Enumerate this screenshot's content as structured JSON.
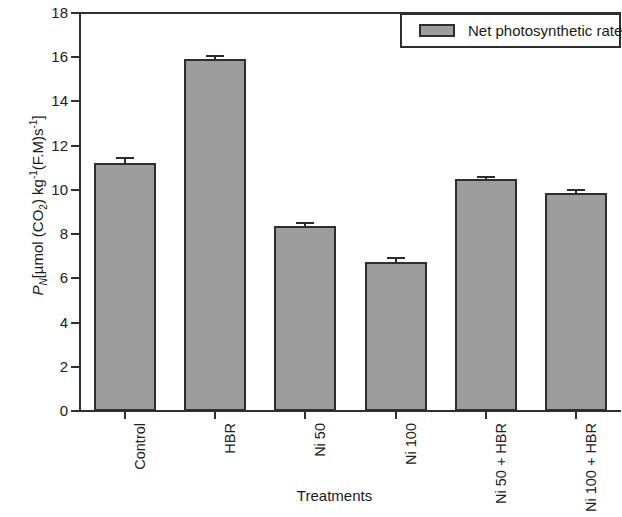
{
  "chart_data": {
    "type": "bar",
    "title": "",
    "xlabel": "Treatments",
    "ylabel_parts": {
      "symbol": "P",
      "subscript": "N",
      "rest_open": "[µmol (CO",
      "co2_sub": "2",
      "rest_mid": ") kg",
      "sup1": "-1",
      "rest_fm": "(F.M)s",
      "sup2": "-1",
      "rest_close": "]"
    },
    "ylabel_text": "PN[µmol (CO2) kg-1(F.M)s-1]",
    "categories": [
      "Control",
      "HBR",
      "Ni 50",
      "Ni 100",
      "Ni 50 + HBR",
      "Ni 100 + HBR"
    ],
    "values": [
      11.2,
      15.9,
      8.35,
      6.75,
      10.5,
      9.85
    ],
    "errors": [
      0.3,
      0.2,
      0.22,
      0.22,
      0.15,
      0.17
    ],
    "ylim": [
      0,
      18
    ],
    "yticks": [
      0,
      2,
      4,
      6,
      8,
      10,
      12,
      14,
      16,
      18
    ],
    "ytick_labels": [
      "0",
      "2",
      "4",
      "6",
      "8",
      "10",
      "12",
      "14",
      "16",
      "18"
    ],
    "grid": false,
    "legend_position": "top-right",
    "series": [
      {
        "name": "Net photosynthetic rate",
        "color": "#9d9d9d",
        "edge_color": "#2e2e2e",
        "values": [
          11.2,
          15.9,
          8.35,
          6.75,
          10.5,
          9.85
        ]
      }
    ]
  },
  "legend": {
    "label": "Net photosynthetic rate"
  },
  "axes": {
    "x_title": "Treatments"
  }
}
